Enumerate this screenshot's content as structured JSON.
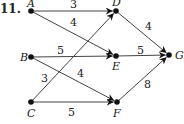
{
  "problem_number": "11.",
  "nodes": [
    {
      "id": "A",
      "label": "A",
      "x": 31,
      "y": 11,
      "lx": 27,
      "ly": 7
    },
    {
      "id": "B",
      "label": "B",
      "x": 31,
      "y": 57,
      "lx": 20,
      "ly": 61
    },
    {
      "id": "C",
      "label": "C",
      "x": 31,
      "y": 102,
      "lx": 27,
      "ly": 117
    },
    {
      "id": "D",
      "label": "D",
      "x": 116,
      "y": 11,
      "lx": 112,
      "ly": 6
    },
    {
      "id": "E",
      "label": "E",
      "x": 116,
      "y": 56,
      "lx": 112,
      "ly": 70
    },
    {
      "id": "F",
      "label": "F",
      "x": 117,
      "y": 102,
      "lx": 113,
      "ly": 117
    },
    {
      "id": "G",
      "label": "G",
      "x": 169,
      "y": 55,
      "lx": 175,
      "ly": 59
    }
  ],
  "edges": [
    {
      "from": "A",
      "to": "D",
      "weight": "3",
      "lx": 70,
      "ly": 8
    },
    {
      "from": "A",
      "to": "E",
      "weight": "4",
      "lx": 70,
      "ly": 26
    },
    {
      "from": "B",
      "to": "E",
      "weight": "5",
      "lx": 57,
      "ly": 54
    },
    {
      "from": "B",
      "to": "F",
      "weight": "4",
      "lx": 77,
      "ly": 77
    },
    {
      "from": "C",
      "to": "D",
      "weight": "3",
      "lx": 41,
      "ly": 82
    },
    {
      "from": "C",
      "to": "F",
      "weight": "5",
      "lx": 68,
      "ly": 116
    },
    {
      "from": "D",
      "to": "G",
      "weight": "4",
      "lx": 145,
      "ly": 30
    },
    {
      "from": "E",
      "to": "G",
      "weight": "5",
      "lx": 137,
      "ly": 54
    },
    {
      "from": "F",
      "to": "G",
      "weight": "8",
      "lx": 144,
      "ly": 88
    }
  ]
}
